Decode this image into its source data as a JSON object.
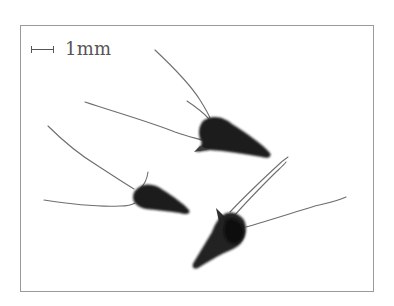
{
  "figure": {
    "scale_bar": {
      "label": "1mm",
      "icon": "scale-bar-icon"
    },
    "specimens": [
      {
        "id": "specimen-1",
        "position": "top-center"
      },
      {
        "id": "specimen-2",
        "position": "middle-left"
      },
      {
        "id": "specimen-3",
        "position": "bottom-center"
      }
    ],
    "colors": {
      "background": "#ffffff",
      "frame_border": "#9a9a9a",
      "scale_text": "#555555",
      "specimen_dark": "#1c1c1c",
      "awn": "#6a6a6a"
    }
  }
}
